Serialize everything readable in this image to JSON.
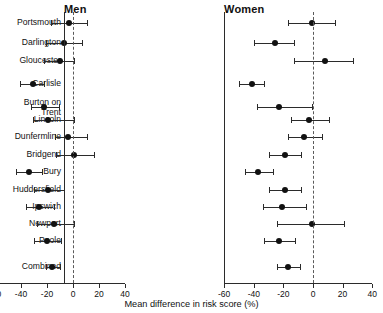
{
  "chart_data": {
    "type": "scatter",
    "title": "",
    "xlabel": "Mean difference in risk score (%)",
    "ylabel": "",
    "xlim": [
      -60,
      40
    ],
    "xticks": [
      -60,
      -40,
      -20,
      0,
      20,
      40
    ],
    "xticklabels": [
      "-60",
      "-40",
      "-20",
      "0",
      "20",
      "40"
    ],
    "grid": false,
    "legend": "none",
    "reference_line": 0,
    "panels": [
      {
        "key": "men",
        "label": "Men"
      },
      {
        "key": "women",
        "label": "Women"
      }
    ],
    "categories": [
      "Portsmouth",
      "Darlington",
      "Gloucester",
      "Carlisle",
      "Burton on\nTrent",
      "Lincoln",
      "Dunfermline",
      "Bridgend",
      "Bury",
      "Huddersfield",
      "Ipswich",
      "Newport",
      "Poole",
      "Combined"
    ],
    "series": [
      {
        "name": "Men",
        "points": [
          {
            "site": "Portsmouth",
            "mean": -3,
            "low": -17,
            "high": 11
          },
          {
            "site": "Darlington",
            "mean": -7,
            "low": -21,
            "high": 7
          },
          {
            "site": "Gloucester",
            "mean": -10,
            "low": -22,
            "high": 1
          },
          {
            "site": "Carlisle",
            "mean": -31,
            "low": -41,
            "high": -22
          },
          {
            "site": "Burton on Trent",
            "mean": -22,
            "low": -32,
            "high": -11
          },
          {
            "site": "Lincoln",
            "mean": -19,
            "low": -31,
            "high": 1
          },
          {
            "site": "Dunfermline",
            "mean": -4,
            "low": -14,
            "high": 11
          },
          {
            "site": "Bridgend",
            "mean": 1,
            "low": -13,
            "high": 16
          },
          {
            "site": "Bury",
            "mean": -34,
            "low": -44,
            "high": -24
          },
          {
            "site": "Huddersfield",
            "mean": -19,
            "low": -30,
            "high": -7
          },
          {
            "site": "Ipswich",
            "mean": -26,
            "low": -36,
            "high": -15
          },
          {
            "site": "Newport",
            "mean": -15,
            "low": -28,
            "high": 1
          },
          {
            "site": "Poole",
            "mean": -20,
            "low": -30,
            "high": -9
          },
          {
            "site": "Combined",
            "mean": -16,
            "low": -21,
            "high": -10
          }
        ]
      },
      {
        "name": "Women",
        "points": [
          {
            "site": "Portsmouth",
            "mean": -1,
            "low": -17,
            "high": 15
          },
          {
            "site": "Darlington",
            "mean": -26,
            "low": -40,
            "high": -13
          },
          {
            "site": "Gloucester",
            "mean": 8,
            "low": -13,
            "high": 27
          },
          {
            "site": "Carlisle",
            "mean": -41,
            "low": -50,
            "high": -33
          },
          {
            "site": "Burton on Trent",
            "mean": -23,
            "low": -38,
            "high": -1
          },
          {
            "site": "Lincoln",
            "mean": -3,
            "low": -15,
            "high": 11
          },
          {
            "site": "Dunfermline",
            "mean": -6,
            "low": -17,
            "high": 6
          },
          {
            "site": "Bridgend",
            "mean": -19,
            "low": -30,
            "high": -8
          },
          {
            "site": "Bury",
            "mean": -37,
            "low": -46,
            "high": -27
          },
          {
            "site": "Huddersfield",
            "mean": -19,
            "low": -30,
            "high": -8
          },
          {
            "site": "Ipswich",
            "mean": -21,
            "low": -34,
            "high": -5
          },
          {
            "site": "Newport",
            "mean": -1,
            "low": -24,
            "high": 21
          },
          {
            "site": "Poole",
            "mean": -23,
            "low": -33,
            "high": -12
          },
          {
            "site": "Combined",
            "mean": -17,
            "low": -24,
            "high": -9
          }
        ]
      }
    ]
  },
  "axis_label": {
    "text": "Mean difference in risk score (%)"
  }
}
